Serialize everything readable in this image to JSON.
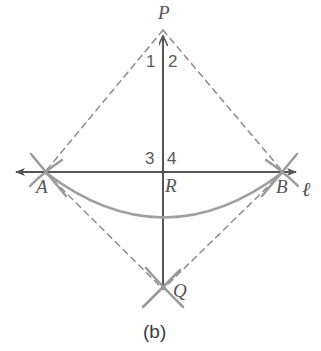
{
  "figure": {
    "caption": "(b)",
    "colors": {
      "solid_line": "#555555",
      "dashed_line": "#8d8d8d",
      "arc": "#9b9b9b",
      "label_text": "#555555",
      "background": "#fefefe"
    }
  },
  "points": [
    {
      "id": "P",
      "label": "P",
      "x": 163,
      "y": 28,
      "label_x": 161,
      "label_y": 3
    },
    {
      "id": "A",
      "label": "A",
      "x": 45,
      "y": 172,
      "label_x": 37,
      "label_y": 178
    },
    {
      "id": "B",
      "label": "B",
      "x": 283,
      "y": 172,
      "label_x": 277,
      "label_y": 178
    },
    {
      "id": "R",
      "label": "R",
      "x": 163,
      "y": 172,
      "label_x": 165,
      "label_y": 176
    },
    {
      "id": "Q",
      "label": "Q",
      "x": 163,
      "y": 290,
      "label_x": 173,
      "label_y": 281
    }
  ],
  "angle_labels": [
    {
      "id": "angle-1",
      "label": "1",
      "x": 146,
      "y": 53
    },
    {
      "id": "angle-2",
      "label": "2",
      "x": 168,
      "y": 53
    },
    {
      "id": "angle-3",
      "label": "3",
      "x": 145,
      "y": 150
    },
    {
      "id": "angle-4",
      "label": "4",
      "x": 167,
      "y": 150
    }
  ],
  "line_label": {
    "id": "line-l",
    "label": "ℓ",
    "x": 302,
    "y": 179
  },
  "segments": [
    {
      "id": "line-l",
      "style": "solid",
      "from": "left-arrow",
      "to": "right-arrow"
    },
    {
      "id": "segment-PQ",
      "style": "solid",
      "from": "P",
      "to": "Q"
    },
    {
      "id": "segment-PA",
      "style": "dashed",
      "from": "P",
      "to": "A"
    },
    {
      "id": "segment-PB",
      "style": "dashed",
      "from": "P",
      "to": "B"
    },
    {
      "id": "segment-AQ",
      "style": "dashed",
      "from": "A",
      "to": "Q"
    },
    {
      "id": "segment-BQ",
      "style": "dashed",
      "from": "B",
      "to": "Q"
    }
  ],
  "arcs": [
    {
      "id": "main-arc-AB",
      "description": "wide construction arc sagging from A through below R to B"
    },
    {
      "id": "cross-mark-A",
      "description": "X crossing of construction arcs at A"
    },
    {
      "id": "cross-mark-B",
      "description": "X crossing of construction arcs at B"
    },
    {
      "id": "cross-mark-Q",
      "description": "X crossing of construction arcs at Q"
    }
  ]
}
